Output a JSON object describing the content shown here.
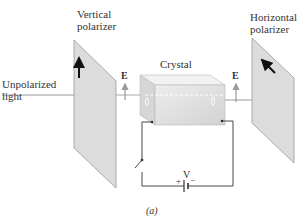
{
  "labels": {
    "vertical_polarizer_1": "Vertical",
    "vertical_polarizer_2": "polarizer",
    "horizontal_polarizer_1": "Horizontal",
    "horizontal_polarizer_2": "polarizer",
    "unpolarized_1": "Unpolarized",
    "unpolarized_2": "light",
    "crystal": "Crystal",
    "e_left": "E",
    "e_right": "E",
    "voltage": "V",
    "plus": "+",
    "minus": "−",
    "caption": "(a)"
  },
  "colors": {
    "panel_fill": "#d9d9d9",
    "panel_edge": "#888888",
    "arrow": "#111111",
    "light_ray": "#9a9a9a",
    "wire": "#333333"
  }
}
